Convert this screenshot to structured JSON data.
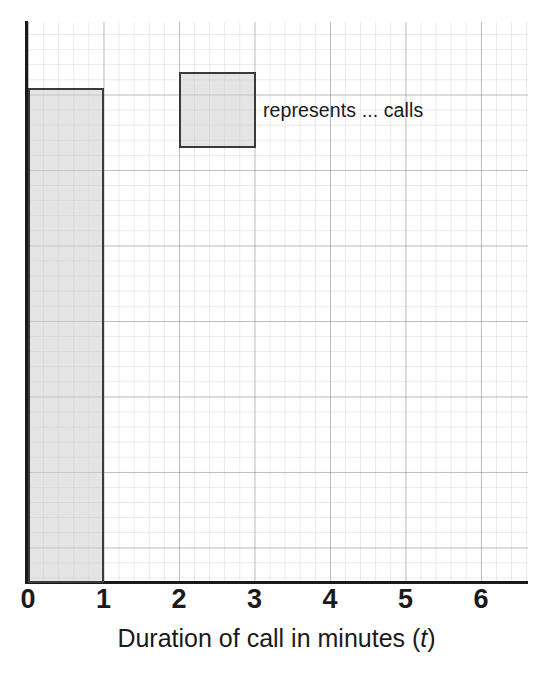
{
  "chart_data": {
    "type": "bar",
    "title": "",
    "subtitle": "",
    "xlabel_prefix": "Duration of call in minutes (",
    "xlabel_variable": "t",
    "xlabel_suffix": ")",
    "ylabel": "",
    "xlim": [
      0,
      6.62
    ],
    "ylim": [
      0,
      6.56
    ],
    "grid": true,
    "grid_major_unit": 1,
    "grid_minor_per_major": 5,
    "legend_position": "inside-top",
    "x_tick_labels": [
      "0",
      "1",
      "2",
      "3",
      "4",
      "5",
      "6"
    ],
    "x_tick_values": [
      0,
      1,
      2,
      3,
      4,
      5,
      6
    ],
    "y_tick_labels": [],
    "bars": [
      {
        "label": "0 – 1",
        "x_start": 0,
        "x_end": 1,
        "height": 5.76,
        "fill": "#cdcdcd",
        "edge": "#3a3a3a"
      }
    ],
    "annotations": [
      {
        "type": "legend-key",
        "swatch_x_start": 2,
        "swatch_x_end": 3,
        "swatch_height": 1,
        "text": "represents ... calls"
      }
    ]
  },
  "legend": {
    "text": "represents ... calls"
  },
  "axis": {
    "x_ticks": [
      "0",
      "1",
      "2",
      "3",
      "4",
      "5",
      "6"
    ],
    "title_prefix": "Duration of call in minutes (",
    "title_variable": "t",
    "title_suffix": ")"
  }
}
